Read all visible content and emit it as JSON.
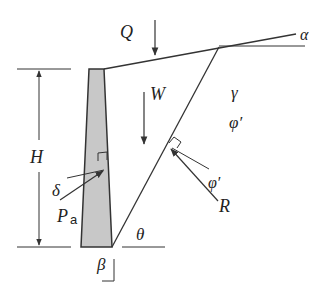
{
  "diagram": {
    "labels": {
      "surcharge": "Q",
      "weight": "W",
      "backfill_slope": "α",
      "unit_weight": "γ",
      "friction_angle": "φ′",
      "friction_angle_on_plane": "φ′",
      "height": "H",
      "wall_friction": "δ",
      "active_force": "P",
      "active_force_subscript": "a",
      "failure_plane_angle": "θ",
      "wall_back_angle": "β",
      "resultant": "R"
    },
    "colors": {
      "line": "#333333",
      "wall_fill": "#c8c8c8",
      "background": "#ffffff"
    }
  }
}
